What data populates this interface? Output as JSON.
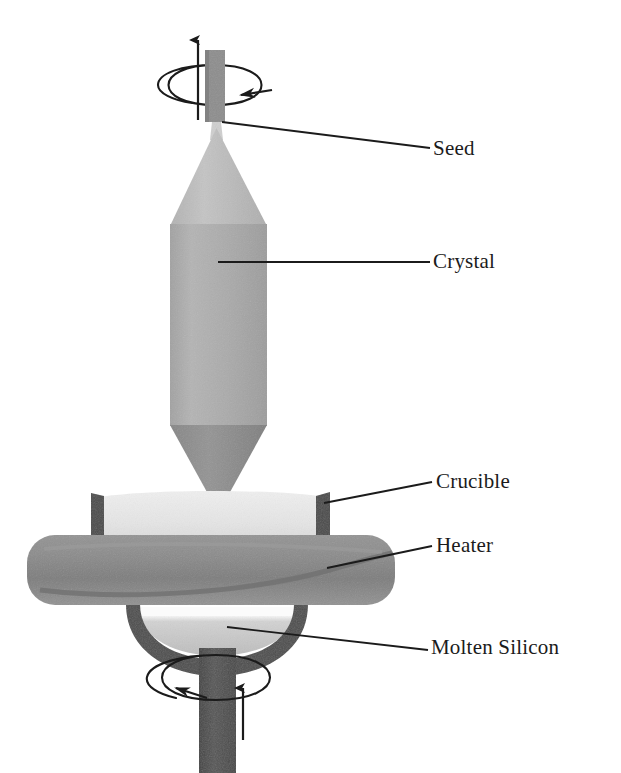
{
  "diagram": {
    "background_color": "#ffffff",
    "labels": [
      {
        "id": "seed",
        "text": "Seed",
        "x": 433,
        "y": 138
      },
      {
        "id": "crystal",
        "text": "Crystal",
        "x": 433,
        "y": 251
      },
      {
        "id": "crucible",
        "text": "Crucible",
        "x": 436,
        "y": 471
      },
      {
        "id": "heater",
        "text": "Heater",
        "x": 436,
        "y": 535
      },
      {
        "id": "molten",
        "text": "Molten Silicon",
        "x": 431,
        "y": 637
      }
    ],
    "leader_lines": [
      {
        "id": "seed-leader",
        "from_x": 222,
        "from_y": 122,
        "to_x": 430,
        "to_y": 148
      },
      {
        "id": "crystal-leader",
        "from_x": 218,
        "from_y": 262,
        "to_x": 430,
        "to_y": 262
      },
      {
        "id": "crucible-leader",
        "from_x": 324,
        "from_y": 503,
        "to_x": 432,
        "to_y": 482
      },
      {
        "id": "heater-leader",
        "from_x": 327,
        "from_y": 568,
        "to_x": 432,
        "to_y": 546
      },
      {
        "id": "molten-leader",
        "from_x": 227,
        "from_y": 627,
        "to_x": 428,
        "to_y": 650
      }
    ],
    "parts": {
      "seed_rod": {
        "name": "seed-rod",
        "color": "#8d8d8d",
        "x": 205,
        "y": 50,
        "w": 20,
        "h": 72
      },
      "crystal_neck": {
        "name": "crystal-neck",
        "color": "#c9c9c9"
      },
      "crystal_cone": {
        "name": "crystal-top-cone",
        "color": "#bdbdbd"
      },
      "crystal_body": {
        "name": "crystal-body",
        "color": "#adadad"
      },
      "crystal_tip": {
        "name": "crystal-bottom-cone",
        "color": "#8c8c8c"
      },
      "crucible_bowl": {
        "name": "crucible-bowl",
        "color": "#e9e9e9"
      },
      "crucible_wall": {
        "name": "crucible-wall",
        "color": "#4a4a4a"
      },
      "heater_ring": {
        "name": "heater-ring",
        "color": "#8a8a8a"
      },
      "molten_silicon": {
        "name": "molten-silicon",
        "color": "#c6c6c6"
      },
      "melt_highlight": {
        "name": "melt-highlight",
        "color": "#fbfbfb"
      },
      "bottom_shaft": {
        "name": "bottom-shaft",
        "color": "#4f4f4f"
      }
    },
    "motion_indicators": {
      "top_pull_arrow": {
        "name": "pull-up-arrow",
        "direction": "up",
        "x": 198,
        "y_from": 120,
        "y_to": 38
      },
      "top_rotation": {
        "name": "seed-rotation-arrow",
        "direction": "clockwise",
        "cx": 215,
        "cy": 85,
        "rx": 62,
        "ry": 20
      },
      "bottom_rotation": {
        "name": "crucible-rotation-arrow",
        "direction": "counter-clockwise",
        "cx": 215,
        "cy": 677,
        "rx": 72,
        "ry": 23
      },
      "bottom_push_arrow": {
        "name": "crucible-lift-arrow",
        "direction": "up",
        "x": 232,
        "y_from": 740,
        "y_to": 688
      }
    },
    "stroke_color": "#1b1b1b"
  }
}
